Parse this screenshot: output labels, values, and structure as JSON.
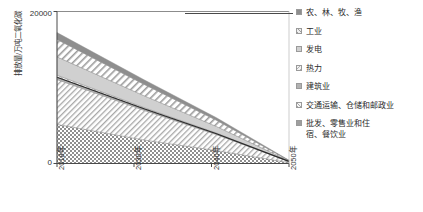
{
  "chart_data": {
    "type": "area",
    "title": "",
    "subtitle": "",
    "xlabel": "",
    "ylabel": "排放量/万吨二氧化碳",
    "stacked": true,
    "grid": false,
    "legend_position": "right",
    "ylim": [
      0,
      20000
    ],
    "yticks": [
      0,
      20000
    ],
    "ytick_labels": [
      "0",
      "20000"
    ],
    "x": [
      2018,
      2030,
      2040,
      2050
    ],
    "xtick_labels": [
      "2018年",
      "2030年",
      "2040年",
      "2050年"
    ],
    "xlim": [
      2018,
      2050
    ],
    "series": [
      {
        "name": "批发、零售业和住\n宿、餐饮业",
        "pattern": "checkerboard",
        "color": "#9e9e9e",
        "values": [
          5150,
          3100,
          1700,
          120
        ]
      },
      {
        "name": "交通运输、仓储和邮政业",
        "pattern": "fine-diagonal",
        "color": "#bdbdbd",
        "values": [
          5900,
          3900,
          2100,
          150
        ]
      },
      {
        "name": "建筑业",
        "pattern": "solid-gray",
        "color": "#b2b2b2",
        "values": [
          300,
          190,
          110,
          10
        ]
      },
      {
        "name": "热力",
        "pattern": "thin-diagonal",
        "color": "#d6d6d6",
        "values": [
          280,
          180,
          100,
          10
        ]
      },
      {
        "name": "发电",
        "pattern": "light-gray",
        "color": "#d0d0d0",
        "values": [
          2400,
          1550,
          860,
          60
        ]
      },
      {
        "name": "工业",
        "pattern": "wide-diagonal",
        "color": "#e8e8e8",
        "values": [
          2300,
          1500,
          820,
          55
        ]
      },
      {
        "name": "农、林、牧、渔",
        "pattern": "solid-dark-gray",
        "color": "#8e8e8e",
        "values": [
          900,
          600,
          330,
          25
        ]
      }
    ],
    "totals": [
      17230,
      11020,
      6020,
      430
    ]
  },
  "axes": {
    "y_title": "排放量/万吨二氧化碳",
    "y_top_label": "20000",
    "y_bottom_label": "0",
    "x_labels": [
      "2018年",
      "2030年",
      "2040年",
      "2050年"
    ]
  },
  "legend": {
    "items": [
      {
        "label": "农、林、牧、渔",
        "swatch": "legend-swatch-agriculture"
      },
      {
        "label": "工业",
        "swatch": "legend-swatch-industry"
      },
      {
        "label": "发电",
        "swatch": "legend-swatch-power"
      },
      {
        "label": "热力",
        "swatch": "legend-swatch-heat"
      },
      {
        "label": "建筑业",
        "swatch": "legend-swatch-construction"
      },
      {
        "label": "交通运输、仓储和邮政业",
        "swatch": "legend-swatch-transport"
      },
      {
        "label": "批发、零售业和住\n宿、餐饮业",
        "swatch": "legend-swatch-retail"
      }
    ]
  },
  "colors": {
    "axis": "#4a4a4a",
    "text": "#2b2b2b",
    "agriculture": "#8e8e8e",
    "industry": "#e8e8e8",
    "power": "#d0d0d0",
    "heat": "#d6d6d6",
    "construction": "#b2b2b2",
    "transport": "#bdbdbd",
    "retail": "#9e9e9e"
  }
}
